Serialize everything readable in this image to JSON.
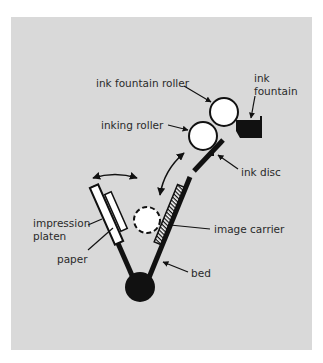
{
  "diagram": {
    "colors": {
      "background": "#ffffff",
      "panel": "#d9d9d9",
      "ink": "#111111",
      "fill_white": "#ffffff",
      "text": "#2a2a2a"
    },
    "labels": {
      "ink_fountain_roller": "ink fountain roller",
      "ink_fountain_line1": "ink",
      "ink_fountain_line2": "fountain",
      "inking_roller": "inking roller",
      "ink_disc": "ink disc",
      "impression_line1": "impression",
      "impression_line2": "platen",
      "paper": "paper",
      "image_carrier": "image carrier",
      "bed": "bed"
    }
  }
}
